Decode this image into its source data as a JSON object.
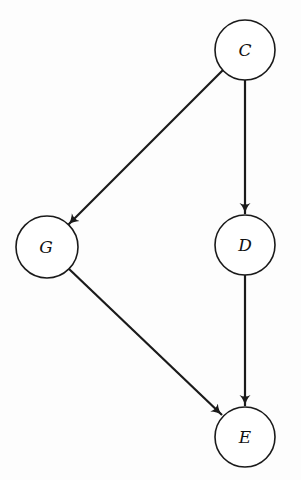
{
  "diagram": {
    "type": "directed-graph",
    "nodes": [
      {
        "id": "C",
        "label": "C",
        "cx": 245,
        "cy": 50,
        "r": 30
      },
      {
        "id": "G",
        "label": "G",
        "cx": 47,
        "cy": 247,
        "r": 31
      },
      {
        "id": "D",
        "label": "D",
        "cx": 245,
        "cy": 245,
        "r": 30
      },
      {
        "id": "E",
        "label": "E",
        "cx": 245,
        "cy": 437,
        "r": 30
      }
    ],
    "edges": [
      {
        "from": "C",
        "to": "G"
      },
      {
        "from": "C",
        "to": "D"
      },
      {
        "from": "G",
        "to": "E"
      },
      {
        "from": "D",
        "to": "E"
      }
    ],
    "colors": {
      "stroke": "#1a1a1a",
      "background": "#fdfdfd",
      "node_fill": "#ffffff"
    }
  }
}
